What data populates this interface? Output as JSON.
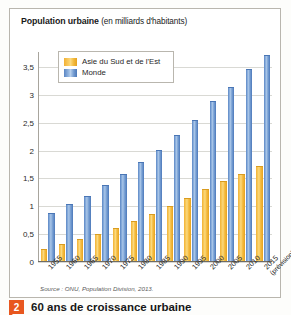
{
  "chart_data": {
    "type": "bar",
    "title": "Population urbaine",
    "subtitle": "(en milliards d'habitants)",
    "xlabel": "",
    "ylabel": "",
    "ylim": [
      0,
      3.75
    ],
    "grid": true,
    "legend_position": "top-left",
    "categories": [
      "1955",
      "1960",
      "1965",
      "1970",
      "1975",
      "1980",
      "1985",
      "1990",
      "1995",
      "2000",
      "2005",
      "2010",
      "2015"
    ],
    "forecast_note": "(prévision)",
    "forecast_category": "2015",
    "ytick_labels": [
      "0",
      "0,5",
      "1",
      "1,5",
      "2",
      "2,5",
      "3",
      "3,5"
    ],
    "ytick_values": [
      0,
      0.5,
      1,
      1.5,
      2,
      2.5,
      3,
      3.5
    ],
    "series": [
      {
        "name": "Asie du Sud et de l'Est",
        "color": "#f5bf45",
        "values": [
          0.2,
          0.28,
          0.37,
          0.47,
          0.58,
          0.7,
          0.83,
          0.97,
          1.12,
          1.28,
          1.42,
          1.55,
          1.68
        ]
      },
      {
        "name": "Monde",
        "color": "#7ba3d6",
        "values": [
          0.85,
          1.0,
          1.15,
          1.35,
          1.55,
          1.75,
          1.98,
          2.25,
          2.52,
          2.85,
          3.1,
          3.42,
          3.67
        ]
      }
    ],
    "source": "Source : ONU, Population Division, 2013."
  },
  "caption": {
    "number": "2",
    "text": "60 ans de croissance urbaine"
  }
}
